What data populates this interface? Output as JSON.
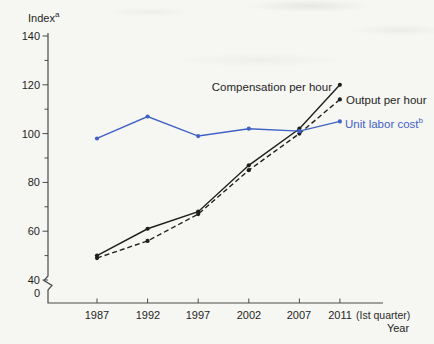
{
  "colors": {
    "axis": "#4a4a4a",
    "black_line": "#1f1f1f",
    "blue_line": "#3f62c4",
    "text": "#1f1f1f"
  },
  "chart_data": {
    "type": "line",
    "title": "",
    "y_axis": {
      "label": "Index",
      "label_sup": "a",
      "ticks": [
        140,
        120,
        100,
        80,
        60,
        40
      ],
      "minor_ticks": [
        130,
        110,
        90,
        70,
        50
      ],
      "origin_label": "0",
      "axis_break": true,
      "range": [
        0,
        140
      ]
    },
    "x_axis": {
      "label": "Year",
      "note": "(Ist quarter)",
      "categories": [
        "1987",
        "1992",
        "1997",
        "2002",
        "2007",
        "2011"
      ]
    },
    "series": [
      {
        "name": "Compensation per hour",
        "name_sup": "",
        "line": "solid",
        "color": "#1f1f1f",
        "values": [
          50,
          61,
          68,
          87,
          102,
          120
        ]
      },
      {
        "name": "Output per hour",
        "name_sup": "",
        "line": "dashed",
        "color": "#1f1f1f",
        "values": [
          49,
          56,
          67,
          85,
          100,
          114
        ]
      },
      {
        "name": "Unit labor cost",
        "name_sup": "b",
        "line": "solid",
        "color": "#3f62c4",
        "values": [
          98,
          107,
          99,
          102,
          101,
          105
        ]
      }
    ],
    "legend_position": "inline-labels-right",
    "grid": false
  }
}
